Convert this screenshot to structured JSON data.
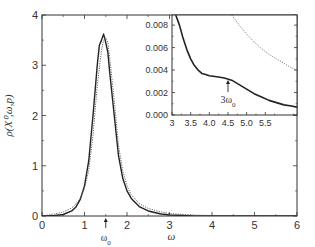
{
  "chart_data": [
    {
      "id": "main",
      "type": "line",
      "title": "",
      "xlabel": "ω",
      "ylabel": "ρ(X⁰,ω,p)",
      "xlim": [
        0,
        6
      ],
      "ylim": [
        0,
        4
      ],
      "xticks": [
        0,
        1,
        2,
        3,
        4,
        5,
        6
      ],
      "xtick_labels": [
        "0",
        "1",
        "2",
        "3",
        "4",
        "5",
        "6"
      ],
      "yticks": [
        0,
        1,
        2,
        3,
        4
      ],
      "ytick_labels": [
        "0",
        "1",
        "2",
        "3",
        "4"
      ],
      "grid": false,
      "series": [
        {
          "name": "solid",
          "style": "solid",
          "color": "#222222",
          "x": [
            0,
            0.3,
            0.5,
            0.7,
            0.8,
            0.9,
            1.0,
            1.1,
            1.2,
            1.3,
            1.35,
            1.4,
            1.45,
            1.5,
            1.55,
            1.6,
            1.7,
            1.8,
            1.9,
            2.0,
            2.1,
            2.3,
            2.5,
            2.8,
            3.0,
            3.5,
            4.0,
            5.0,
            6.0
          ],
          "y": [
            0,
            0.01,
            0.03,
            0.1,
            0.18,
            0.33,
            0.6,
            1.1,
            2.0,
            3.0,
            3.4,
            3.5,
            3.62,
            3.45,
            3.25,
            2.8,
            2.0,
            1.2,
            0.75,
            0.5,
            0.35,
            0.18,
            0.1,
            0.04,
            0.02,
            0.006,
            0.003,
            0.001,
            0
          ]
        },
        {
          "name": "dotted",
          "style": "dotted",
          "color": "#666666",
          "x": [
            0,
            0.3,
            0.5,
            0.7,
            0.8,
            0.9,
            1.0,
            1.1,
            1.2,
            1.3,
            1.4,
            1.45,
            1.5,
            1.55,
            1.6,
            1.7,
            1.8,
            1.9,
            2.0,
            2.1,
            2.3,
            2.5,
            2.8,
            3.0,
            3.5,
            4.0,
            5.0,
            6.0
          ],
          "y": [
            0,
            0.04,
            0.08,
            0.16,
            0.24,
            0.35,
            0.55,
            0.9,
            1.6,
            2.6,
            3.3,
            3.5,
            3.55,
            3.45,
            3.1,
            2.3,
            1.4,
            0.9,
            0.6,
            0.42,
            0.24,
            0.15,
            0.08,
            0.05,
            0.02,
            0.01,
            0.004,
            0.002
          ]
        }
      ],
      "annotations": [
        {
          "text": "ω0",
          "x": 1.5,
          "arrow": "up",
          "position": "below-axis"
        }
      ]
    },
    {
      "id": "inset",
      "type": "line",
      "title": "",
      "xlabel": "",
      "ylabel": "",
      "xlim": [
        3,
        6.35
      ],
      "ylim": [
        0,
        0.0089
      ],
      "xticks": [
        3,
        3.5,
        4.0,
        4.5,
        5.0,
        5.5
      ],
      "xtick_labels": [
        "3",
        "3.5",
        "4.0",
        "4.5",
        "5.0",
        "5.5"
      ],
      "yticks": [
        0,
        0.002,
        0.004,
        0.006,
        0.008
      ],
      "ytick_labels": [
        "0.000",
        "0.002",
        "0.004",
        "0.006",
        "0.008"
      ],
      "grid": false,
      "series": [
        {
          "name": "solid",
          "style": "solid",
          "color": "#222222",
          "x": [
            3.1,
            3.2,
            3.3,
            3.4,
            3.5,
            3.6,
            3.7,
            3.8,
            3.9,
            4.0,
            4.2,
            4.4,
            4.6,
            4.8,
            5.0,
            5.2,
            5.4,
            5.6,
            5.8,
            6.0,
            6.2,
            6.35
          ],
          "y": [
            0.0089,
            0.008,
            0.0068,
            0.0058,
            0.005,
            0.0044,
            0.004,
            0.0037,
            0.0036,
            0.0035,
            0.0034,
            0.0033,
            0.0031,
            0.0027,
            0.0023,
            0.0019,
            0.0016,
            0.0013,
            0.0011,
            0.0009,
            0.0008,
            0.0007
          ]
        },
        {
          "name": "dotted",
          "style": "dotted",
          "color": "#888888",
          "x": [
            4.6,
            4.8,
            5.0,
            5.2,
            5.4,
            5.6,
            5.8,
            6.0,
            6.2,
            6.35
          ],
          "y": [
            0.0089,
            0.008,
            0.0072,
            0.0065,
            0.0059,
            0.0054,
            0.005,
            0.0046,
            0.0042,
            0.004
          ]
        }
      ],
      "annotations": [
        {
          "text": "3ω0",
          "x": 4.5,
          "arrow": "up",
          "position": "below-curve"
        }
      ]
    }
  ]
}
